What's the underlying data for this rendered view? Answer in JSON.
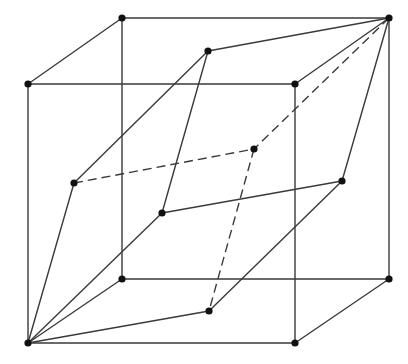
{
  "diagram": {
    "title": "Rhombohedron inscribed in a cube (wireframe)",
    "colors": {
      "line": "#3a3a3a",
      "vertex": "#111111",
      "background": "#ffffff"
    },
    "vertices": {
      "cube_back_top_left": [
        122,
        18
      ],
      "cube_back_top_right": [
        389,
        18
      ],
      "cube_front_top_left": [
        28,
        84
      ],
      "cube_front_top_right": [
        295,
        84
      ],
      "cube_back_bottom_left": [
        122,
        279
      ],
      "cube_back_bottom_right": [
        389,
        279
      ],
      "cube_front_bottom_left": [
        28,
        343
      ],
      "cube_front_bottom_right": [
        295,
        343
      ],
      "inner_top": [
        208,
        51
      ],
      "inner_left": [
        74,
        183
      ],
      "inner_back": [
        254,
        149
      ],
      "inner_right": [
        342,
        181
      ],
      "inner_front": [
        162,
        213
      ],
      "inner_bottom": [
        209,
        311
      ]
    },
    "edges": [
      {
        "from": "cube_back_top_left",
        "to": "cube_back_top_right",
        "style": "solid"
      },
      {
        "from": "cube_back_top_left",
        "to": "cube_front_top_left",
        "style": "solid"
      },
      {
        "from": "cube_back_top_left",
        "to": "cube_back_bottom_left",
        "style": "solid"
      },
      {
        "from": "cube_back_top_right",
        "to": "cube_front_top_right",
        "style": "solid"
      },
      {
        "from": "cube_back_top_right",
        "to": "cube_back_bottom_right",
        "style": "solid"
      },
      {
        "from": "cube_front_top_left",
        "to": "cube_front_top_right",
        "style": "solid"
      },
      {
        "from": "cube_front_top_left",
        "to": "cube_front_bottom_left",
        "style": "solid"
      },
      {
        "from": "cube_front_top_right",
        "to": "cube_front_bottom_right",
        "style": "solid"
      },
      {
        "from": "cube_back_bottom_left",
        "to": "cube_back_bottom_right",
        "style": "solid"
      },
      {
        "from": "cube_back_bottom_left",
        "to": "cube_front_bottom_left",
        "style": "solid"
      },
      {
        "from": "cube_back_bottom_right",
        "to": "cube_front_bottom_right",
        "style": "solid"
      },
      {
        "from": "cube_front_bottom_left",
        "to": "cube_front_bottom_right",
        "style": "solid"
      },
      {
        "from": "cube_back_top_right",
        "to": "inner_top",
        "style": "solid"
      },
      {
        "from": "cube_back_top_right",
        "to": "inner_right",
        "style": "solid"
      },
      {
        "from": "cube_back_top_right",
        "to": "inner_back",
        "style": "dashed"
      },
      {
        "from": "inner_top",
        "to": "inner_left",
        "style": "solid"
      },
      {
        "from": "inner_top",
        "to": "inner_front",
        "style": "solid"
      },
      {
        "from": "inner_left",
        "to": "inner_back",
        "style": "dashed"
      },
      {
        "from": "inner_left",
        "to": "cube_front_bottom_left",
        "style": "solid"
      },
      {
        "from": "inner_front",
        "to": "inner_right",
        "style": "solid"
      },
      {
        "from": "inner_front",
        "to": "cube_front_bottom_left",
        "style": "solid"
      },
      {
        "from": "inner_back",
        "to": "inner_bottom",
        "style": "dashed"
      },
      {
        "from": "inner_right",
        "to": "inner_bottom",
        "style": "solid"
      },
      {
        "from": "inner_bottom",
        "to": "cube_front_bottom_left",
        "style": "solid"
      }
    ],
    "vertex_radius": 3.6
  }
}
